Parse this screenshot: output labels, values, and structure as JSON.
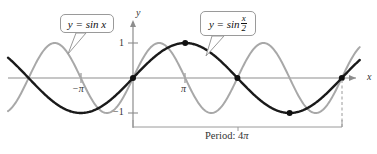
{
  "figure": {
    "background": "#ffffff",
    "width": 377,
    "height": 154
  },
  "axes": {
    "x_label": "x",
    "y_label": "y",
    "origin_px": [
      133,
      78
    ],
    "pi_px": 52.2,
    "unit_y_px": 35,
    "x_axis_color": "#8d8d8d",
    "y_axis_color": "#8d8d8d",
    "x_range_px": [
      8,
      360
    ],
    "y_ticks": [
      {
        "label": "1",
        "value": 1
      },
      {
        "label": "−1",
        "value": -1
      }
    ],
    "x_ticks": [
      {
        "label": "−π",
        "value": -3.14159
      },
      {
        "label": "π",
        "value": 3.14159
      }
    ]
  },
  "callouts": [
    {
      "name": "callout-sin-x",
      "text": "y = sin x",
      "target_curve": "sin x"
    },
    {
      "name": "callout-sin-half-x",
      "prefix": "y = sin",
      "numerator": "x",
      "denominator": "2",
      "target_curve": "sin (x/2)"
    }
  ],
  "annotation": {
    "period_prefix": "Period: 4",
    "period_symbol": "π",
    "bracket_from_x": 0,
    "bracket_to_x": 12.566,
    "bracket_color": "#9a9a9a",
    "dashed_color": "#9a9a9a"
  },
  "chart_data": {
    "type": "line",
    "title": "",
    "xlabel": "x",
    "ylabel": "y",
    "xlim": [
      -2.394,
      4.345
    ],
    "xlim_units": "pi",
    "ylim": [
      -1.35,
      1.35
    ],
    "grid": false,
    "legend": "callouts",
    "series": [
      {
        "name": "sin x",
        "expression": "y = sin x",
        "color": "#a8a8a8",
        "width": 2.0,
        "amplitude": 1,
        "period_pi": 2,
        "zorder": 1
      },
      {
        "name": "sin (x/2)",
        "expression": "y = sin(x/2)",
        "color": "#1a1a1a",
        "width": 2.4,
        "amplitude": 1,
        "period_pi": 4,
        "zorder": 2
      }
    ],
    "marked_points": [
      {
        "x_pi": 0,
        "y": 0,
        "label": ""
      },
      {
        "x_pi": 1,
        "y": 1,
        "label": ""
      },
      {
        "x_pi": 2,
        "y": 0,
        "label": ""
      },
      {
        "x_pi": 3,
        "y": -1,
        "label": ""
      },
      {
        "x_pi": 4,
        "y": 0,
        "label": ""
      }
    ],
    "marked_point_color": "#111111",
    "annotations": [
      {
        "text": "Period: 4π",
        "from_x_pi": 0,
        "to_x_pi": 4
      }
    ]
  }
}
